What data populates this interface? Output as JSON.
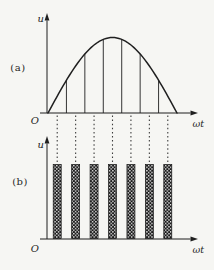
{
  "figure": {
    "background_color": "#f6f6f3",
    "ink_color": "#1f1f1f",
    "panel_a": {
      "label": "(a)",
      "y_axis_label": "u",
      "x_axis_label": "ωt",
      "origin_label": "O"
    },
    "panel_b": {
      "label": "(b)",
      "y_axis_label": "u",
      "x_axis_label": "ωt",
      "origin_label": "O"
    }
  },
  "chart_data": [
    {
      "type": "line",
      "panel": "a",
      "title": "",
      "xlabel": "ωt",
      "ylabel": "u",
      "curve_shape": "half-sine",
      "x_range": [
        0,
        1
      ],
      "y_range": [
        0,
        1
      ],
      "num_segments": 7,
      "segment_divider_x": [
        0.1429,
        0.2857,
        0.4286,
        0.5714,
        0.7143,
        0.8571
      ],
      "segment_divider_height": [
        0.4339,
        0.7818,
        0.9749,
        0.9749,
        0.7818,
        0.4339
      ],
      "grid": false,
      "legend": false
    },
    {
      "type": "bar",
      "panel": "b",
      "title": "",
      "xlabel": "ωt",
      "ylabel": "u",
      "x_range": [
        0,
        1
      ],
      "y_range": [
        0,
        1
      ],
      "bar_centers_x": [
        0.0714,
        0.2143,
        0.3571,
        0.5,
        0.6429,
        0.7857,
        0.9286
      ],
      "bar_heights": [
        1,
        1,
        1,
        1,
        1,
        1,
        1
      ],
      "bar_width_x": 0.062,
      "bar_fill": "checkerboard-hatch",
      "grid": false,
      "legend": false
    }
  ],
  "connectors": {
    "style": "dashed",
    "count": 7,
    "x_positions": [
      0.0714,
      0.2143,
      0.3571,
      0.5,
      0.6429,
      0.7857,
      0.9286
    ]
  }
}
